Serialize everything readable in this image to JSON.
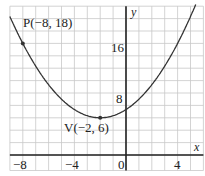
{
  "chart_data": {
    "type": "line",
    "title": "",
    "xlabel": "x",
    "ylabel": "y",
    "xlim": [
      -9,
      6
    ],
    "ylim": [
      -2.5,
      24
    ],
    "grid": true,
    "x_grid_step": 1,
    "y_grid_step": 2,
    "x_ticks": [
      -8,
      -4,
      0,
      4
    ],
    "x_tick_labels": [
      "−8",
      "−4",
      "0",
      "4"
    ],
    "y_ticks": [
      8,
      16
    ],
    "y_tick_labels": [
      "8",
      "16"
    ],
    "series": [
      {
        "name": "parabola",
        "equation": "y = (1/3)(x + 2)^2 + 6",
        "vertex": [
          -2,
          6
        ],
        "a": 0.3333
      }
    ],
    "points": [
      {
        "name": "P",
        "x": -8,
        "y": 18,
        "label": "P(−8, 18)"
      },
      {
        "name": "V",
        "x": -2,
        "y": 6,
        "label": "V(−2, 6)"
      }
    ],
    "colors": {
      "curve": "#333333",
      "grid": "#c8c8c8",
      "axis": "#222222"
    }
  },
  "labels": {
    "x_axis": "x",
    "y_axis": "y",
    "origin": "0",
    "x_m8": "−8",
    "x_m4": "−4",
    "x_4": "4",
    "y_8": "8",
    "y_16": "16",
    "point_p": "P(−8, 18)",
    "point_v": "V(−2, 6)"
  }
}
